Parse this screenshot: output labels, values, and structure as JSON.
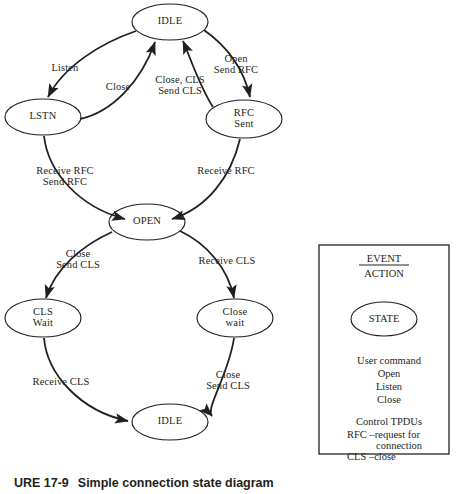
{
  "figure": {
    "caption_number": "URE 17-9",
    "caption_text": "Simple connection state diagram"
  },
  "diagram": {
    "type": "state-transition-diagram",
    "states": [
      {
        "id": "idle_top",
        "label": "IDLE",
        "cx": 170,
        "cy": 22,
        "rx": 38,
        "ry": 18
      },
      {
        "id": "lstn",
        "label": "LSTN",
        "cx": 43,
        "cy": 117,
        "rx": 38,
        "ry": 18
      },
      {
        "id": "rfc_sent",
        "label": "RFC\nSent",
        "cx": 244,
        "cy": 119,
        "rx": 38,
        "ry": 19
      },
      {
        "id": "open",
        "label": "OPEN",
        "cx": 147,
        "cy": 222,
        "rx": 38,
        "ry": 18
      },
      {
        "id": "cls_wait",
        "label": "CLS\nWait",
        "cx": 43,
        "cy": 318,
        "rx": 38,
        "ry": 19
      },
      {
        "id": "close_wait",
        "label": "Close\nwait",
        "cx": 235,
        "cy": 318,
        "rx": 38,
        "ry": 19
      },
      {
        "id": "idle_bot",
        "label": "IDLE",
        "cx": 170,
        "cy": 422,
        "rx": 38,
        "ry": 18
      }
    ],
    "transitions": [
      {
        "id": "t1",
        "from": "idle_top",
        "to": "lstn",
        "label": "Listen"
      },
      {
        "id": "t2",
        "from": "lstn",
        "to": "idle_top",
        "label": "Close"
      },
      {
        "id": "t3",
        "from": "rfc_sent",
        "to": "idle_top",
        "label": "Close, CLS\nSend CLS"
      },
      {
        "id": "t4",
        "from": "idle_top",
        "to": "rfc_sent",
        "label": "Open\nSend RFC"
      },
      {
        "id": "t5",
        "from": "lstn",
        "to": "open",
        "label": "Receive RFC\nSend RFC"
      },
      {
        "id": "t6",
        "from": "rfc_sent",
        "to": "open",
        "label": "Receive RFC"
      },
      {
        "id": "t7",
        "from": "open",
        "to": "cls_wait",
        "label": "Close\nSend CLS"
      },
      {
        "id": "t8",
        "from": "open",
        "to": "close_wait",
        "label": "Receive CLS"
      },
      {
        "id": "t9",
        "from": "cls_wait",
        "to": "idle_bot",
        "label": "Receive CLS"
      },
      {
        "id": "t10",
        "from": "close_wait",
        "to": "idle_bot",
        "label": "Close\nSend CLS"
      }
    ]
  },
  "legend": {
    "event_label": "EVENT",
    "action_label": "ACTION",
    "state_label": "STATE",
    "groups": [
      {
        "heading": "User command",
        "items": [
          "Open",
          "Listen",
          "Close"
        ]
      },
      {
        "heading": "Control TPDUs",
        "items": [
          "RFC –request for",
          "connection",
          "CLS –close"
        ]
      }
    ]
  }
}
